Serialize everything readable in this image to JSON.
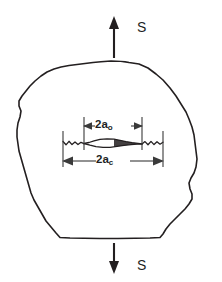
{
  "figure": {
    "name": "fracture-mechanics-crack-diagram",
    "background_color": "#ffffff",
    "line_color": "#231f20",
    "dimension_line_color": "#3a3a3a"
  },
  "stress": {
    "top": {
      "label": "S",
      "arrow_direction": "up",
      "icon": "arrow-up-icon"
    },
    "bottom": {
      "label": "S",
      "arrow_direction": "down",
      "icon": "arrow-down-icon"
    }
  },
  "dimensions": [
    {
      "id": "a-o",
      "base": "2a",
      "subscript": "o",
      "full_label": "2a_o",
      "meaning": "original flaw size",
      "position": "above-crack",
      "arrow_style": "double-headed-inward"
    },
    {
      "id": "a-c",
      "base": "2a",
      "subscript": "c",
      "full_label": "2a_c",
      "meaning": "critical crack size",
      "position": "below-crack",
      "arrow_style": "double-headed-outward"
    }
  ],
  "body": {
    "shape": "irregular-rounded-polygon",
    "flaw": {
      "shape": "thin-lens-crack-with-jagged-extensions",
      "orientation": "horizontal"
    }
  }
}
